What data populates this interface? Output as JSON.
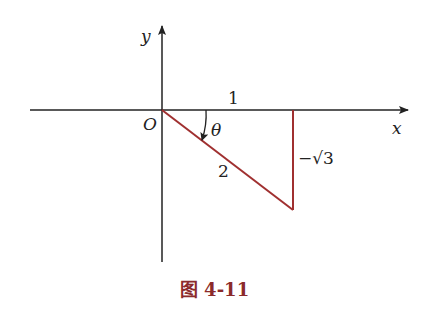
{
  "figure": {
    "caption": "图 4-11",
    "axes": {
      "x_label": "x",
      "y_label": "y",
      "origin_label": "O"
    },
    "triangle": {
      "adjacent_label": "1",
      "hypotenuse_label": "2",
      "opposite_label": "−√3",
      "angle_label": "θ"
    },
    "colors": {
      "axis": "#222222",
      "triangle": "#a03030",
      "caption": "#8b2b2b"
    }
  }
}
